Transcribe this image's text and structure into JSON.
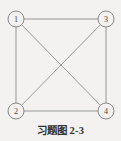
{
  "figure": {
    "caption_label": "习题图",
    "caption_number": "2-3",
    "caption_full": "习题图 2-3",
    "background_color": "#f3f2f0",
    "line_color": "#8d8d8d",
    "node_stroke_color": "#7d7d7d",
    "label_color": "#4a4645",
    "caption_color": "#363231"
  },
  "chart_data": {
    "type": "diagram",
    "graph_kind": "undirected complete graph K4",
    "nodes": [
      {
        "id": "1",
        "label": "1",
        "x": 16,
        "y": 19,
        "r": 8
      },
      {
        "id": "3",
        "label": "3",
        "x": 106,
        "y": 19,
        "r": 8
      },
      {
        "id": "2",
        "label": "2",
        "x": 16,
        "y": 111,
        "r": 8
      },
      {
        "id": "4",
        "label": "4",
        "x": 106,
        "y": 111,
        "r": 8
      }
    ],
    "edges": [
      {
        "from": "1",
        "to": "3",
        "kind": "top-side"
      },
      {
        "from": "1",
        "to": "2",
        "kind": "left-side"
      },
      {
        "from": "2",
        "to": "4",
        "kind": "bottom-side"
      },
      {
        "from": "3",
        "to": "4",
        "kind": "right-side"
      },
      {
        "from": "1",
        "to": "4",
        "kind": "diagonal"
      },
      {
        "from": "2",
        "to": "3",
        "kind": "diagonal"
      }
    ],
    "node_count": 4,
    "edge_count": 6
  }
}
